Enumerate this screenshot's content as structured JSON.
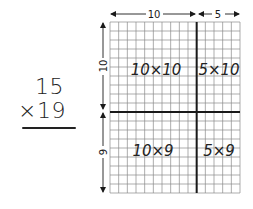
{
  "problem": {
    "multiplicand": "15",
    "multiplier": "×19",
    "operator": "×"
  },
  "grid": {
    "columns": 15,
    "rows": 19,
    "split_column": 10,
    "split_row": 10
  },
  "dimensions": {
    "top": [
      {
        "label": "10",
        "span": 10
      },
      {
        "label": "5",
        "span": 5
      }
    ],
    "left": [
      {
        "label": "10",
        "span": 10
      },
      {
        "label": "9",
        "span": 9
      }
    ]
  },
  "regions": {
    "top_left": "10×10",
    "top_right": "5×10",
    "bottom_left": "10×9",
    "bottom_right": "5×9"
  },
  "colors": {
    "grid_line": "#8a8a8a",
    "thick_line": "#1a1a1a",
    "ink": "#222222",
    "background": "#ffffff"
  }
}
